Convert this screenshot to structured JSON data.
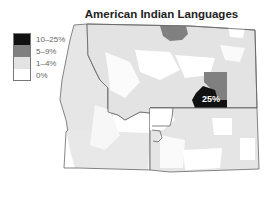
{
  "title": "American Indian Languages",
  "legend": {
    "items": [
      {
        "label": "10–25%",
        "color": "#111111"
      },
      {
        "label": "5–9%",
        "color": "#808080"
      },
      {
        "label": "1–4%",
        "color": "#e3e3e3"
      },
      {
        "label": "0%",
        "color": "#ffffff"
      }
    ]
  },
  "map": {
    "states": [
      "Idaho",
      "Montana",
      "Wyoming"
    ],
    "annotation": "25%",
    "colors": {
      "high": "#111111",
      "mid": "#808080",
      "low": "#e3e3e3",
      "none": "#ffffff",
      "border": "#666666"
    }
  }
}
